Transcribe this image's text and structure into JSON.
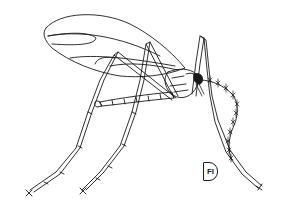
{
  "figure": {
    "label": "FI",
    "ink_color": "#1a1a1a",
    "background_color": "#ffffff"
  }
}
